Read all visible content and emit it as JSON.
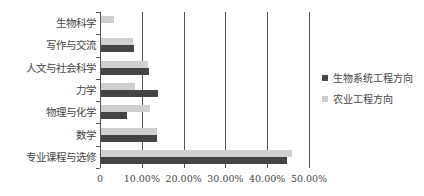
{
  "chart_data": {
    "type": "bar",
    "orientation": "horizontal",
    "title": "",
    "xlabel": "",
    "ylabel": "",
    "xlim": [
      0,
      0.5
    ],
    "x_ticks": [
      "0",
      "10.00%",
      "20.00%",
      "30.00%",
      "40.00%",
      "50.00%"
    ],
    "categories": [
      "生物科学",
      "写作与交流",
      "人文与社会科学",
      "力学",
      "物理与化学",
      "数学",
      "专业课程与选修"
    ],
    "series": [
      {
        "name": "生物系统工程方向",
        "color": "#444444",
        "values": [
          0.0,
          0.08,
          0.116,
          0.137,
          0.063,
          0.135,
          0.445
        ]
      },
      {
        "name": "农业工程方向",
        "color": "#cfcfcf",
        "values": [
          0.031,
          0.077,
          0.113,
          0.082,
          0.118,
          0.133,
          0.457
        ]
      }
    ],
    "grid": true,
    "legend_position": "right"
  }
}
